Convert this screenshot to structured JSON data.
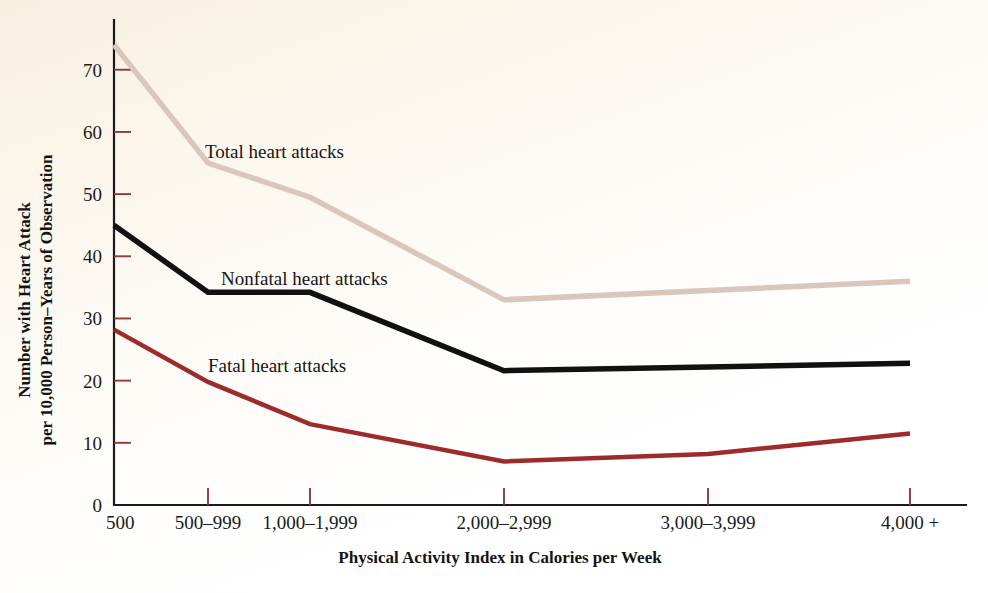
{
  "chart_data": {
    "type": "line",
    "title": "",
    "subtitle": "",
    "xlabel": "Physical Activity Index in Calories per Week",
    "ylabel": "Number with Heart Attack\nper 10,000 Person–Years of Observation",
    "ylabel_line1": "Number with Heart Attack",
    "ylabel_line2": "per 10,000 Person–Years of Observation",
    "categories": [
      "500",
      "500–999",
      "1,000–1,999",
      "2,000–2,999",
      "3,000–3,999",
      "4,000 +"
    ],
    "x_positions": [
      114,
      208,
      310,
      504,
      708,
      910
    ],
    "ylim": [
      0,
      78
    ],
    "yticks": [
      0,
      10,
      20,
      30,
      40,
      50,
      60,
      70
    ],
    "ytick_labels": [
      "0",
      "10",
      "20",
      "30",
      "40",
      "50",
      "60",
      "70"
    ],
    "grid": false,
    "legend": "inline-annotations",
    "series": [
      {
        "name": "Total heart attacks",
        "color": "#d9c6bd",
        "width": 5.5,
        "values": [
          74.0,
          55.0,
          49.5,
          33.0,
          34.5,
          36.0
        ],
        "label_x": 205,
        "label_y": 158
      },
      {
        "name": "Nonfatal heart attacks",
        "color": "#111111",
        "width": 5.5,
        "values": [
          45.0,
          34.2,
          34.2,
          21.6,
          22.2,
          22.8
        ],
        "label_x": 221,
        "label_y": 285
      },
      {
        "name": "Fatal heart attacks",
        "color": "#9e2b2b",
        "width": 4.5,
        "values": [
          28.2,
          19.8,
          13.0,
          7.0,
          8.2,
          11.5
        ],
        "label_x": 208,
        "label_y": 372
      }
    ],
    "colors": {
      "background": "#fdfaf3",
      "axis": "#1b1b1b",
      "tick_mark": "#8d3a3a",
      "total_series": "#d9c6bd",
      "nonfatal_series": "#111111",
      "fatal_series": "#9e2b2b",
      "text": "#141414"
    }
  }
}
